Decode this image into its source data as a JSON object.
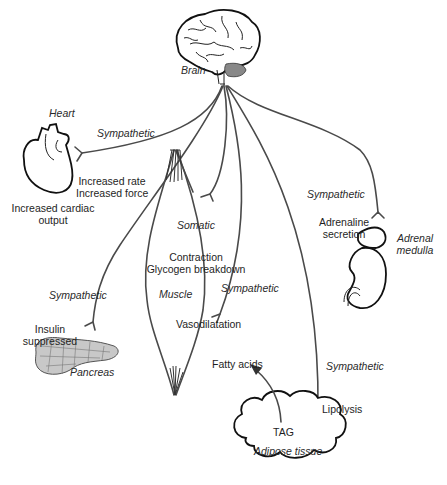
{
  "diagram": {
    "colors": {
      "line": "#4a4a4a",
      "text": "#1e1e1e",
      "organ_outline": "#111111",
      "pancreas_fill": "#c8c8c8"
    },
    "organs": {
      "brain": "Brain",
      "heart": "Heart",
      "muscle": "Muscle",
      "pancreas": "Pancreas",
      "adrenal": "Adrenal\nmedulla",
      "adrenal_line1": "Adrenal",
      "adrenal_line2": "medulla",
      "adipose": "Adipose tissue",
      "tag": "TAG"
    },
    "pathways": {
      "heart": "Sympathetic",
      "adrenal": "Sympathetic",
      "muscle_somatic": "Somatic",
      "muscle_vessel": "Sympathetic",
      "pancreas": "Sympathetic",
      "adipose": "Sympathetic"
    },
    "effects": {
      "heart_line1": "Increased rate",
      "heart_line2": "Increased force",
      "cardiac_line1": "Increased cardiac",
      "cardiac_line2": "output",
      "adrenal_line1": "Adrenaline",
      "adrenal_line2": "secretion",
      "muscle_line1": "Contraction",
      "muscle_line2": "Glycogen breakdown",
      "vessel": "Vasodilatation",
      "pancreas_line1": "Insulin",
      "pancreas_line2": "suppressed",
      "fatty_acids": "Fatty acids",
      "lipolysis": "Lipolysis"
    }
  }
}
